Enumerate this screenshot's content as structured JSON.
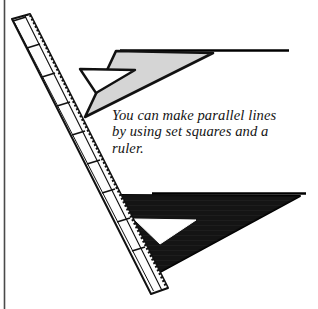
{
  "figure": {
    "caption": "You can make parallel lines\nby using set squares and a\nruler.",
    "caption_lines": [
      "You can make parallel lines",
      "by using set squares and a",
      "ruler."
    ],
    "colors": {
      "background": "#ffffff",
      "ink": "#000000",
      "border_rule": "#4a4a4a",
      "light_set_square_fill": "#d5d5d5",
      "light_set_square_stroke": "#111111",
      "dark_set_square_fill": "#141414",
      "dark_set_square_stroke": "#000000",
      "ruler_fill": "#fdfdfd",
      "ruler_stroke": "#111111",
      "cutout_fill": "#ffffff",
      "caption_text": "#141414"
    },
    "elements": {
      "left_border_rule": "vertical-rule",
      "ruler": "ruler",
      "light_set_square": "upper-set-square",
      "dark_set_square": "lower-set-square",
      "upper_parallel_line": "upper-parallel-line",
      "lower_parallel_line": "lower-parallel-line"
    },
    "ruler": {
      "tick_count": 9,
      "label": "ruler"
    },
    "geometry": {
      "left_rule_x": 4.5,
      "upper_line_y": 50.5,
      "upper_line_x2": 289,
      "lower_line_y": 193.5,
      "lower_line_x2": 306
    }
  }
}
